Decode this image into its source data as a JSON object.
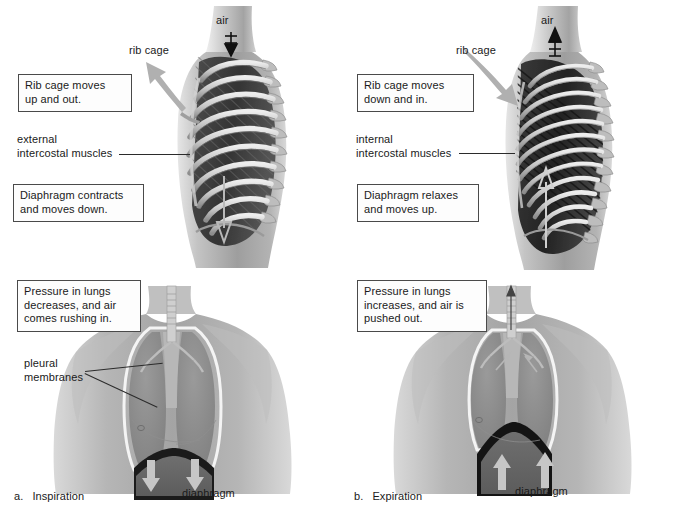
{
  "figure": {
    "panels": [
      {
        "id": "inspiration",
        "caption_letter": "a.",
        "caption_text": "Inspiration",
        "air_label": "air",
        "air_direction": "down",
        "ribcage_label": "rib cage",
        "ribcage_arrow_direction": "up-and-out",
        "muscle_label": "external\nintercostal muscles",
        "diaphragm_label": "diaphragm",
        "diaphragm_arrow_direction": "down",
        "pleural_label": "pleural\nmembranes",
        "callouts": [
          {
            "name": "ribcage-motion",
            "text": "Rib cage moves\nup and out."
          },
          {
            "name": "diaphragm-motion",
            "text": "Diaphragm contracts\nand moves down."
          },
          {
            "name": "pressure-change",
            "text": "Pressure in lungs\ndecreases, and air\ncomes rushing in."
          }
        ]
      },
      {
        "id": "expiration",
        "caption_letter": "b.",
        "caption_text": "Expiration",
        "air_label": "air",
        "air_direction": "up",
        "ribcage_label": "rib cage",
        "ribcage_arrow_direction": "down-and-in",
        "muscle_label": "internal\nintercostal muscles",
        "diaphragm_label": "diaphragm",
        "diaphragm_arrow_direction": "up",
        "pleural_label": "",
        "callouts": [
          {
            "name": "ribcage-motion",
            "text": "Rib cage moves\ndown and in."
          },
          {
            "name": "diaphragm-motion",
            "text": "Diaphragm relaxes\nand moves up."
          },
          {
            "name": "pressure-change",
            "text": "Pressure in lungs\nincreases, and air is\npushed out."
          }
        ]
      }
    ]
  },
  "colors": {
    "background": "#ffffff",
    "text": "#1a1a1a",
    "box_border": "#4a4a4a",
    "leader_line": "#2b2b2b",
    "skin_light": "#c9c9c9",
    "skin_mid": "#a9a9a9",
    "skin_dark": "#8b8b8b",
    "lung_fill": "#8e8e8e",
    "pleura_highlight": "#f2f2f2",
    "diaphragm_dark": "#1d1d1d",
    "abdomen_fill": "#6e6e6e",
    "rib_light": "#d6d6d6",
    "rib_shadow": "#6a6a6a",
    "intercostal_dark": "#2f2f2f",
    "gray_arrow": "#b8b8b8",
    "black_arrow": "#111111"
  }
}
